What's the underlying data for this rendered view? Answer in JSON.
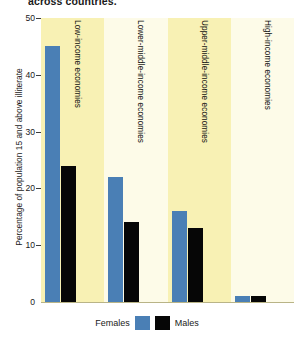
{
  "title_partial": "across countries.",
  "legend": {
    "female_label": "Females",
    "male_label": "Males"
  },
  "colors": {
    "female": "#4a7fb5",
    "male": "#060606",
    "band": "#f8f1b4",
    "band_light": "#fdfbe8"
  },
  "chart_data": {
    "type": "bar",
    "title": "across countries.",
    "xlabel": "",
    "ylabel": "Percentage of population 15 and above illiterate",
    "ylim": [
      0,
      50
    ],
    "yticks": [
      0,
      10,
      20,
      30,
      40,
      50
    ],
    "ytick_labels": [
      "0",
      "10",
      "20",
      "30",
      "40",
      "50"
    ],
    "grid": false,
    "legend_position": "bottom",
    "categories": [
      "Low-income economies",
      "Lower-middle-income economies",
      "Upper-middle-income economies",
      "High-income economies"
    ],
    "series": [
      {
        "name": "Females",
        "color": "#4a7fb5",
        "values": [
          45,
          22,
          16,
          1
        ]
      },
      {
        "name": "Males",
        "color": "#060606",
        "values": [
          24,
          14,
          13,
          1
        ]
      }
    ]
  }
}
